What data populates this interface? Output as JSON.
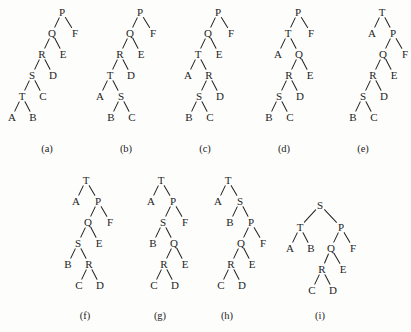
{
  "figure": {
    "background_color": "#fdfdfc",
    "ink_color": "#1d1d1d",
    "width": 411,
    "height": 332,
    "node_font_size": 11,
    "caption_font_size": 10.5,
    "level_gap": 21,
    "half_gap": 10.5
  },
  "trees": [
    {
      "id": "a",
      "caption": "(a)",
      "caption_x": 47,
      "caption_y": 148,
      "root_x": 62,
      "root_y": 12,
      "nodes": [
        {
          "label": "P",
          "x": 62,
          "y": 12,
          "level": 0
        },
        {
          "label": "Q",
          "x": 52,
          "y": 33,
          "level": 1
        },
        {
          "label": "F",
          "x": 75,
          "y": 33,
          "level": 1
        },
        {
          "label": "R",
          "x": 42,
          "y": 54,
          "level": 2
        },
        {
          "label": "E",
          "x": 63,
          "y": 54,
          "level": 2
        },
        {
          "label": "S",
          "x": 32,
          "y": 75,
          "level": 3
        },
        {
          "label": "D",
          "x": 53,
          "y": 75,
          "level": 3
        },
        {
          "label": "T",
          "x": 22,
          "y": 96,
          "level": 4
        },
        {
          "label": "C",
          "x": 43,
          "y": 96,
          "level": 4
        },
        {
          "label": "A",
          "x": 12,
          "y": 117,
          "level": 5
        },
        {
          "label": "B",
          "x": 33,
          "y": 117,
          "level": 5
        }
      ],
      "edges": [
        [
          "P",
          "Q"
        ],
        [
          "P",
          "F"
        ],
        [
          "Q",
          "R"
        ],
        [
          "Q",
          "E"
        ],
        [
          "R",
          "S"
        ],
        [
          "R",
          "D"
        ],
        [
          "S",
          "T"
        ],
        [
          "S",
          "C"
        ],
        [
          "T",
          "A"
        ],
        [
          "T",
          "B"
        ]
      ]
    },
    {
      "id": "b",
      "caption": "(b)",
      "caption_x": 126,
      "caption_y": 148,
      "root_x": 140,
      "root_y": 12,
      "nodes": [
        {
          "label": "P",
          "x": 140,
          "y": 12,
          "level": 0
        },
        {
          "label": "Q",
          "x": 130,
          "y": 33,
          "level": 1
        },
        {
          "label": "F",
          "x": 153,
          "y": 33,
          "level": 1
        },
        {
          "label": "R",
          "x": 120,
          "y": 54,
          "level": 2
        },
        {
          "label": "E",
          "x": 141,
          "y": 54,
          "level": 2
        },
        {
          "label": "T",
          "x": 110,
          "y": 75,
          "level": 3
        },
        {
          "label": "D",
          "x": 131,
          "y": 75,
          "level": 3
        },
        {
          "label": "A",
          "x": 100,
          "y": 96,
          "level": 4
        },
        {
          "label": "S",
          "x": 121,
          "y": 96,
          "level": 4
        },
        {
          "label": "B",
          "x": 111,
          "y": 117,
          "level": 5
        },
        {
          "label": "C",
          "x": 132,
          "y": 117,
          "level": 5
        }
      ],
      "edges": [
        [
          "P",
          "Q"
        ],
        [
          "P",
          "F"
        ],
        [
          "Q",
          "R"
        ],
        [
          "Q",
          "E"
        ],
        [
          "R",
          "T"
        ],
        [
          "R",
          "D"
        ],
        [
          "T",
          "A"
        ],
        [
          "T",
          "S"
        ],
        [
          "S",
          "B"
        ],
        [
          "S",
          "C"
        ]
      ]
    },
    {
      "id": "c",
      "caption": "(c)",
      "caption_x": 205,
      "caption_y": 148,
      "root_x": 218,
      "root_y": 12,
      "nodes": [
        {
          "label": "P",
          "x": 218,
          "y": 12,
          "level": 0
        },
        {
          "label": "Q",
          "x": 208,
          "y": 33,
          "level": 1
        },
        {
          "label": "F",
          "x": 231,
          "y": 33,
          "level": 1
        },
        {
          "label": "T",
          "x": 198,
          "y": 54,
          "level": 2
        },
        {
          "label": "E",
          "x": 219,
          "y": 54,
          "level": 2
        },
        {
          "label": "A",
          "x": 188,
          "y": 75,
          "level": 3
        },
        {
          "label": "R",
          "x": 209,
          "y": 75,
          "level": 3
        },
        {
          "label": "S",
          "x": 199,
          "y": 96,
          "level": 4
        },
        {
          "label": "D",
          "x": 220,
          "y": 96,
          "level": 4
        },
        {
          "label": "B",
          "x": 189,
          "y": 117,
          "level": 5
        },
        {
          "label": "C",
          "x": 210,
          "y": 117,
          "level": 5
        }
      ],
      "edges": [
        [
          "P",
          "Q"
        ],
        [
          "P",
          "F"
        ],
        [
          "Q",
          "T"
        ],
        [
          "Q",
          "E"
        ],
        [
          "T",
          "A"
        ],
        [
          "T",
          "R"
        ],
        [
          "R",
          "S"
        ],
        [
          "R",
          "D"
        ],
        [
          "S",
          "B"
        ],
        [
          "S",
          "C"
        ]
      ]
    },
    {
      "id": "d",
      "caption": "(d)",
      "caption_x": 284,
      "caption_y": 148,
      "root_x": 298,
      "root_y": 12,
      "nodes": [
        {
          "label": "P",
          "x": 298,
          "y": 12,
          "level": 0
        },
        {
          "label": "T",
          "x": 288,
          "y": 33,
          "level": 1
        },
        {
          "label": "F",
          "x": 311,
          "y": 33,
          "level": 1
        },
        {
          "label": "A",
          "x": 278,
          "y": 54,
          "level": 2
        },
        {
          "label": "Q",
          "x": 299,
          "y": 54,
          "level": 2
        },
        {
          "label": "R",
          "x": 289,
          "y": 75,
          "level": 3
        },
        {
          "label": "E",
          "x": 310,
          "y": 75,
          "level": 3
        },
        {
          "label": "S",
          "x": 279,
          "y": 96,
          "level": 4
        },
        {
          "label": "D",
          "x": 300,
          "y": 96,
          "level": 4
        },
        {
          "label": "B",
          "x": 269,
          "y": 117,
          "level": 5
        },
        {
          "label": "C",
          "x": 290,
          "y": 117,
          "level": 5
        }
      ],
      "edges": [
        [
          "P",
          "T"
        ],
        [
          "P",
          "F"
        ],
        [
          "T",
          "A"
        ],
        [
          "T",
          "Q"
        ],
        [
          "Q",
          "R"
        ],
        [
          "Q",
          "E"
        ],
        [
          "R",
          "S"
        ],
        [
          "R",
          "D"
        ],
        [
          "S",
          "B"
        ],
        [
          "S",
          "C"
        ]
      ]
    },
    {
      "id": "e",
      "caption": "(e)",
      "caption_x": 363,
      "caption_y": 148,
      "root_x": 382,
      "root_y": 12,
      "nodes": [
        {
          "label": "T",
          "x": 382,
          "y": 12,
          "level": 0
        },
        {
          "label": "A",
          "x": 372,
          "y": 33,
          "level": 1
        },
        {
          "label": "P",
          "x": 393,
          "y": 33,
          "level": 1
        },
        {
          "label": "Q",
          "x": 383,
          "y": 54,
          "level": 2
        },
        {
          "label": "F",
          "x": 405,
          "y": 54,
          "level": 2
        },
        {
          "label": "R",
          "x": 373,
          "y": 75,
          "level": 3
        },
        {
          "label": "E",
          "x": 394,
          "y": 75,
          "level": 3
        },
        {
          "label": "S",
          "x": 363,
          "y": 96,
          "level": 4
        },
        {
          "label": "D",
          "x": 384,
          "y": 96,
          "level": 4
        },
        {
          "label": "B",
          "x": 353,
          "y": 117,
          "level": 5
        },
        {
          "label": "C",
          "x": 374,
          "y": 117,
          "level": 5
        }
      ],
      "edges": [
        [
          "T",
          "A"
        ],
        [
          "T",
          "P"
        ],
        [
          "P",
          "Q"
        ],
        [
          "P",
          "F"
        ],
        [
          "Q",
          "R"
        ],
        [
          "Q",
          "E"
        ],
        [
          "R",
          "S"
        ],
        [
          "R",
          "D"
        ],
        [
          "S",
          "B"
        ],
        [
          "S",
          "C"
        ]
      ]
    },
    {
      "id": "f",
      "caption": "(f)",
      "caption_x": 85,
      "caption_y": 315,
      "root_x": 86,
      "root_y": 180,
      "nodes": [
        {
          "label": "T",
          "x": 86,
          "y": 180,
          "level": 0
        },
        {
          "label": "A",
          "x": 76,
          "y": 201,
          "level": 1
        },
        {
          "label": "P",
          "x": 98,
          "y": 201,
          "level": 1
        },
        {
          "label": "Q",
          "x": 88,
          "y": 222,
          "level": 2
        },
        {
          "label": "F",
          "x": 110,
          "y": 222,
          "level": 2
        },
        {
          "label": "S",
          "x": 78,
          "y": 243,
          "level": 3
        },
        {
          "label": "E",
          "x": 99,
          "y": 243,
          "level": 3
        },
        {
          "label": "B",
          "x": 68,
          "y": 264,
          "level": 4
        },
        {
          "label": "R",
          "x": 89,
          "y": 264,
          "level": 4
        },
        {
          "label": "C",
          "x": 79,
          "y": 285,
          "level": 5
        },
        {
          "label": "D",
          "x": 100,
          "y": 285,
          "level": 5
        }
      ],
      "edges": [
        [
          "T",
          "A"
        ],
        [
          "T",
          "P"
        ],
        [
          "P",
          "Q"
        ],
        [
          "P",
          "F"
        ],
        [
          "Q",
          "S"
        ],
        [
          "Q",
          "E"
        ],
        [
          "S",
          "B"
        ],
        [
          "S",
          "R"
        ],
        [
          "R",
          "C"
        ],
        [
          "R",
          "D"
        ]
      ]
    },
    {
      "id": "g",
      "caption": "(g)",
      "caption_x": 160,
      "caption_y": 315,
      "root_x": 161,
      "root_y": 180,
      "nodes": [
        {
          "label": "T",
          "x": 161,
          "y": 180,
          "level": 0
        },
        {
          "label": "A",
          "x": 151,
          "y": 201,
          "level": 1
        },
        {
          "label": "P",
          "x": 173,
          "y": 201,
          "level": 1
        },
        {
          "label": "S",
          "x": 163,
          "y": 222,
          "level": 2
        },
        {
          "label": "F",
          "x": 185,
          "y": 222,
          "level": 2
        },
        {
          "label": "B",
          "x": 153,
          "y": 243,
          "level": 3
        },
        {
          "label": "Q",
          "x": 174,
          "y": 243,
          "level": 3
        },
        {
          "label": "R",
          "x": 164,
          "y": 264,
          "level": 4
        },
        {
          "label": "E",
          "x": 185,
          "y": 264,
          "level": 4
        },
        {
          "label": "C",
          "x": 154,
          "y": 285,
          "level": 5
        },
        {
          "label": "D",
          "x": 175,
          "y": 285,
          "level": 5
        }
      ],
      "edges": [
        [
          "T",
          "A"
        ],
        [
          "T",
          "P"
        ],
        [
          "P",
          "S"
        ],
        [
          "P",
          "F"
        ],
        [
          "S",
          "B"
        ],
        [
          "S",
          "Q"
        ],
        [
          "Q",
          "R"
        ],
        [
          "Q",
          "E"
        ],
        [
          "R",
          "C"
        ],
        [
          "R",
          "D"
        ]
      ]
    },
    {
      "id": "h",
      "caption": "(h)",
      "caption_x": 227,
      "caption_y": 315,
      "root_x": 228,
      "root_y": 180,
      "nodes": [
        {
          "label": "T",
          "x": 228,
          "y": 180,
          "level": 0
        },
        {
          "label": "A",
          "x": 218,
          "y": 201,
          "level": 1
        },
        {
          "label": "S",
          "x": 240,
          "y": 201,
          "level": 1
        },
        {
          "label": "B",
          "x": 230,
          "y": 222,
          "level": 2
        },
        {
          "label": "P",
          "x": 251,
          "y": 222,
          "level": 2
        },
        {
          "label": "Q",
          "x": 241,
          "y": 243,
          "level": 3
        },
        {
          "label": "F",
          "x": 263,
          "y": 243,
          "level": 3
        },
        {
          "label": "R",
          "x": 231,
          "y": 264,
          "level": 4
        },
        {
          "label": "E",
          "x": 252,
          "y": 264,
          "level": 4
        },
        {
          "label": "C",
          "x": 221,
          "y": 285,
          "level": 5
        },
        {
          "label": "D",
          "x": 242,
          "y": 285,
          "level": 5
        }
      ],
      "edges": [
        [
          "T",
          "A"
        ],
        [
          "T",
          "S"
        ],
        [
          "S",
          "B"
        ],
        [
          "S",
          "P"
        ],
        [
          "P",
          "Q"
        ],
        [
          "P",
          "F"
        ],
        [
          "Q",
          "R"
        ],
        [
          "Q",
          "E"
        ],
        [
          "R",
          "C"
        ],
        [
          "R",
          "D"
        ]
      ]
    },
    {
      "id": "i",
      "caption": "(i)",
      "caption_x": 320,
      "caption_y": 315,
      "root_x": 320,
      "root_y": 205,
      "nodes": [
        {
          "label": "S",
          "x": 320,
          "y": 205,
          "level": 0
        },
        {
          "label": "T",
          "x": 300,
          "y": 227,
          "level": 1
        },
        {
          "label": "P",
          "x": 341,
          "y": 227,
          "level": 1
        },
        {
          "label": "A",
          "x": 290,
          "y": 248,
          "level": 2
        },
        {
          "label": "B",
          "x": 311,
          "y": 248,
          "level": 2
        },
        {
          "label": "Q",
          "x": 331,
          "y": 248,
          "level": 2
        },
        {
          "label": "F",
          "x": 353,
          "y": 248,
          "level": 2
        },
        {
          "label": "R",
          "x": 322,
          "y": 269,
          "level": 3
        },
        {
          "label": "E",
          "x": 343,
          "y": 269,
          "level": 3
        },
        {
          "label": "C",
          "x": 312,
          "y": 290,
          "level": 4
        },
        {
          "label": "D",
          "x": 333,
          "y": 290,
          "level": 4
        }
      ],
      "edges": [
        [
          "S",
          "T"
        ],
        [
          "S",
          "P"
        ],
        [
          "T",
          "A"
        ],
        [
          "T",
          "B"
        ],
        [
          "P",
          "Q"
        ],
        [
          "P",
          "F"
        ],
        [
          "Q",
          "R"
        ],
        [
          "Q",
          "E"
        ],
        [
          "R",
          "C"
        ],
        [
          "R",
          "D"
        ]
      ]
    }
  ]
}
